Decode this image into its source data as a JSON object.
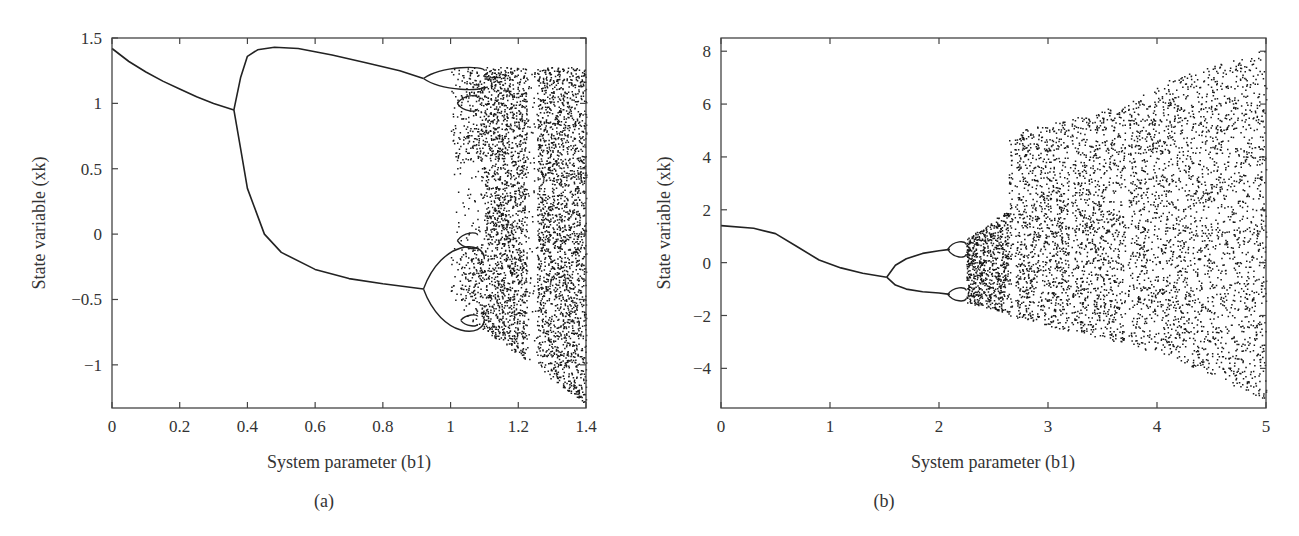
{
  "chart_data": [
    {
      "id": "a",
      "type": "scatter",
      "subtype": "bifurcation-diagram",
      "panel_label": "(a)",
      "title": "",
      "xlabel": "System parameter (b1)",
      "ylabel": "State variable (xk)",
      "xlim": [
        0,
        1.4
      ],
      "ylim": [
        -1.33,
        1.5
      ],
      "xticks": [
        0,
        0.2,
        0.4,
        0.6,
        0.8,
        1,
        1.2,
        1.4
      ],
      "xtick_labels": [
        "0",
        "0.2",
        "0.4",
        "0.6",
        "0.8",
        "1",
        "1.2",
        "1.4"
      ],
      "yticks": [
        1.5,
        1,
        0.5,
        0,
        -0.5,
        -1
      ],
      "ytick_labels": [
        "1.5",
        "1",
        "0.5",
        "0",
        "−0.5",
        "−1"
      ],
      "grid": false,
      "legend": null,
      "series": [
        {
          "name": "period-1 branch",
          "x": [
            0,
            0.05,
            0.1,
            0.15,
            0.2,
            0.25,
            0.3,
            0.36
          ],
          "y": [
            1.42,
            1.32,
            1.24,
            1.17,
            1.11,
            1.05,
            1.0,
            0.95
          ]
        },
        {
          "name": "period-2 upper branch",
          "x": [
            0.36,
            0.38,
            0.4,
            0.43,
            0.48,
            0.55,
            0.65,
            0.75,
            0.85,
            0.92
          ],
          "y": [
            0.95,
            1.2,
            1.36,
            1.41,
            1.43,
            1.42,
            1.37,
            1.31,
            1.25,
            1.19
          ]
        },
        {
          "name": "period-2 lower branch",
          "x": [
            0.36,
            0.38,
            0.4,
            0.45,
            0.5,
            0.6,
            0.7,
            0.8,
            0.92
          ],
          "y": [
            0.95,
            0.65,
            0.35,
            -0.0,
            -0.14,
            -0.27,
            -0.34,
            -0.38,
            -0.42
          ]
        }
      ],
      "features": {
        "first_bifurcation_b1": 0.36,
        "second_bifurcation_b1": 0.92,
        "period_4_bifurcation_b1": 1.03,
        "chaos_onset_b1": 1.1,
        "periodic_window_b1": [
          1.22,
          1.27
        ],
        "chaos_upper_bound_at_1_4": 1.28,
        "chaos_lower_bound_at_1_4": -1.28
      }
    },
    {
      "id": "b",
      "type": "scatter",
      "subtype": "bifurcation-diagram",
      "panel_label": "(b)",
      "title": "",
      "xlabel": "System parameter (b1)",
      "ylabel": "State variable (xk)",
      "xlim": [
        0,
        5
      ],
      "ylim": [
        -5.5,
        8.5
      ],
      "xticks": [
        0,
        1,
        2,
        3,
        4,
        5
      ],
      "xtick_labels": [
        "0",
        "1",
        "2",
        "3",
        "4",
        "5"
      ],
      "yticks": [
        8,
        6,
        4,
        2,
        0,
        -2,
        -4
      ],
      "ytick_labels": [
        "8",
        "6",
        "4",
        "2",
        "0",
        "−2",
        "−4"
      ],
      "grid": false,
      "legend": null,
      "series": [
        {
          "name": "period-1 branch",
          "x": [
            0,
            0.3,
            0.5,
            0.7,
            0.9,
            1.1,
            1.3,
            1.52
          ],
          "y": [
            1.4,
            1.3,
            1.1,
            0.6,
            0.1,
            -0.2,
            -0.4,
            -0.55
          ]
        },
        {
          "name": "period-2 upper branch",
          "x": [
            1.52,
            1.6,
            1.7,
            1.85,
            2.0,
            2.1
          ],
          "y": [
            -0.55,
            -0.1,
            0.15,
            0.35,
            0.45,
            0.5
          ]
        },
        {
          "name": "period-2 lower branch",
          "x": [
            1.52,
            1.6,
            1.7,
            1.85,
            2.0,
            2.1
          ],
          "y": [
            -0.55,
            -0.85,
            -1.0,
            -1.1,
            -1.15,
            -1.2
          ]
        }
      ],
      "features": {
        "first_bifurcation_b1": 1.52,
        "period_4_bifurcation_b1": 2.1,
        "chaos_onset_b1": 2.25,
        "crisis_b1": 2.63,
        "chaos_upper_bound": [
          [
            2.25,
            0.9
          ],
          [
            2.63,
            2.0
          ],
          [
            2.64,
            4.9
          ],
          [
            3.7,
            6.0
          ],
          [
            4.1,
            6.9
          ],
          [
            5.0,
            8.1
          ]
        ],
        "chaos_lower_bound": [
          [
            2.25,
            -1.5
          ],
          [
            2.63,
            -1.9
          ],
          [
            2.64,
            -2.0
          ],
          [
            4.1,
            -3.5
          ],
          [
            5.0,
            -5.2
          ]
        ],
        "white_gaps_b1": [
          2.68,
          3.2,
          3.72
        ]
      }
    }
  ]
}
